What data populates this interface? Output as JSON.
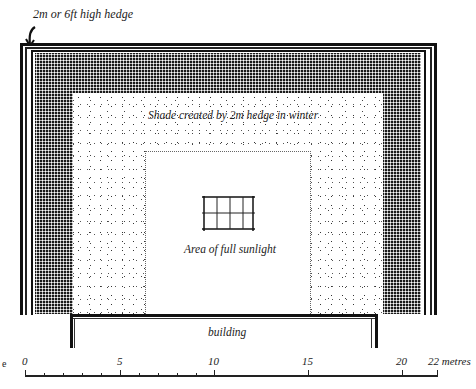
{
  "diagram": {
    "title_annotation": "2m or 6ft high hedge",
    "zones": {
      "hedge": "2m or 6ft high hedge",
      "shade": "Shade created by 2m hedge in winter",
      "sun": "Area of full sunlight",
      "building": "building"
    },
    "left_margin_letter": "e",
    "scale": {
      "labels": [
        "0",
        "5",
        "10",
        "15",
        "20",
        "22 metres"
      ],
      "positions_metres": [
        0,
        5,
        10,
        15,
        20,
        22
      ],
      "unit": "metres",
      "minor_tick_interval_metres": 1,
      "minor_ticks_until": 10
    },
    "colors": {
      "ink": "#111111",
      "paper": "#ffffff",
      "dense_shade": "#1a1a1a"
    }
  }
}
